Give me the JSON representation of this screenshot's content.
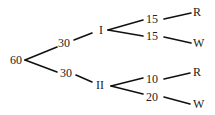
{
  "diagram": {
    "type": "tree-diagram",
    "root": {
      "label": "60"
    },
    "level1": [
      {
        "count": "30",
        "label": "I"
      },
      {
        "count": "30",
        "label": "II"
      }
    ],
    "level2": {
      "I": [
        {
          "count": "15",
          "outcome": "R"
        },
        {
          "count": "15",
          "outcome": "W"
        }
      ],
      "II": [
        {
          "count": "10",
          "outcome": "R"
        },
        {
          "count": "20",
          "outcome": "W"
        }
      ]
    }
  }
}
